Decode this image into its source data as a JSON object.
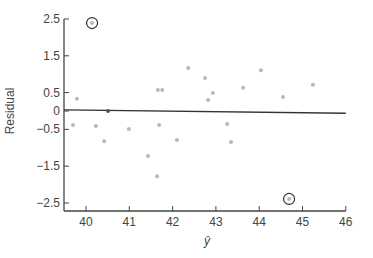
{
  "chart_data": {
    "type": "scatter",
    "title": "",
    "xlabel": "ŷ",
    "ylabel": "Residual",
    "xlim": [
      39.5,
      46
    ],
    "ylim": [
      -2.7,
      2.5
    ],
    "grid": false,
    "legend": null,
    "x_ticks": [
      40,
      41,
      42,
      43,
      44,
      45,
      46
    ],
    "x_tick_labels": [
      "40",
      "41",
      "42",
      "43",
      "44",
      "45",
      "46"
    ],
    "y_ticks": [
      2.5,
      1.5,
      0.5,
      0,
      -0.5,
      -1.5,
      -2.5
    ],
    "y_tick_labels": [
      "2.5",
      "1.5",
      "0.5",
      "0",
      "−0.5",
      "−1.5",
      "−2.5"
    ],
    "points": [
      {
        "x": 39.79,
        "y": 0.33
      },
      {
        "x": 39.7,
        "y": -0.38
      },
      {
        "x": 40.23,
        "y": -0.41
      },
      {
        "x": 40.51,
        "y": 0.0
      },
      {
        "x": 40.42,
        "y": -0.82
      },
      {
        "x": 40.99,
        "y": -0.49
      },
      {
        "x": 41.43,
        "y": -1.22
      },
      {
        "x": 41.64,
        "y": -1.77
      },
      {
        "x": 41.69,
        "y": -0.38
      },
      {
        "x": 41.66,
        "y": 0.57
      },
      {
        "x": 41.76,
        "y": 0.57
      },
      {
        "x": 42.1,
        "y": -0.79
      },
      {
        "x": 42.36,
        "y": 1.17
      },
      {
        "x": 42.75,
        "y": 0.9
      },
      {
        "x": 42.82,
        "y": 0.3
      },
      {
        "x": 42.93,
        "y": 0.49
      },
      {
        "x": 43.26,
        "y": -0.35
      },
      {
        "x": 43.35,
        "y": -0.84
      },
      {
        "x": 43.63,
        "y": 0.63
      },
      {
        "x": 44.04,
        "y": 1.11
      },
      {
        "x": 44.55,
        "y": 0.38
      },
      {
        "x": 45.24,
        "y": 0.71
      }
    ],
    "outliers_circled": [
      {
        "x": 40.14,
        "y": 2.39
      },
      {
        "x": 44.69,
        "y": -2.39
      }
    ],
    "reference_line": {
      "x": [
        39.5,
        46
      ],
      "y": [
        0.03,
        -0.06
      ]
    },
    "colors": {
      "points": "#b8b8b8",
      "axis": "#444444",
      "line": "#333333"
    }
  }
}
